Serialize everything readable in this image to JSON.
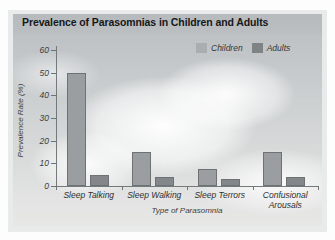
{
  "chart_data": {
    "type": "bar",
    "title": "Prevalence of Parasomnias in Children and Adults",
    "xlabel": "Type of Parasomnia",
    "ylabel": "Prevalence Rate (%)",
    "categories": [
      "Sleep Talking",
      "Sleep Walking",
      "Sleep Terrors",
      "Confusional Arousals"
    ],
    "series": [
      {
        "name": "Children",
        "color": "#9a9ea1",
        "values": [
          50,
          15,
          7.5,
          15
        ]
      },
      {
        "name": "Adults",
        "color": "#83878a",
        "values": [
          5,
          4,
          3,
          4
        ]
      }
    ],
    "ylim": [
      0,
      60
    ],
    "yticks": [
      0,
      10,
      20,
      30,
      40,
      50,
      60
    ],
    "ytick_labels": [
      "0",
      "10",
      "20",
      "30",
      "40",
      "50",
      "60"
    ],
    "grid": false,
    "legend_position": "top-right"
  },
  "legend": {
    "items": [
      {
        "label": "Children",
        "swatch": "children-swatch"
      },
      {
        "label": "Adults",
        "swatch": "adults-swatch"
      }
    ]
  },
  "colors": {
    "children": "#9a9ea1",
    "adults": "#83878a",
    "axis": "#74797c",
    "title_text": "#15181a"
  }
}
